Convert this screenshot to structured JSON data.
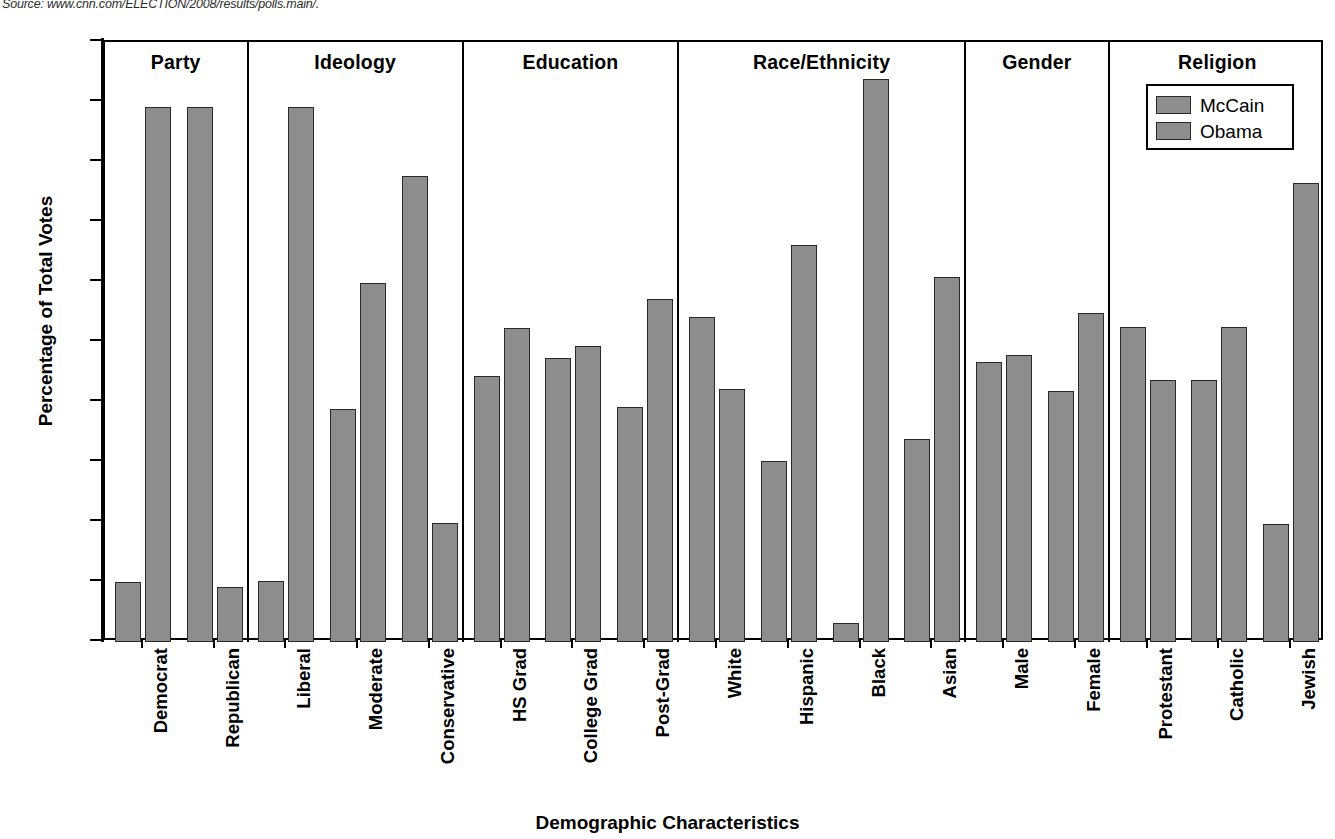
{
  "source_note": "Source: www.cnn.com/ELECTION/2008/results/polls.main/.",
  "legend": {
    "position": "inside-top-right",
    "entries": [
      {
        "label": "McCain",
        "color": "#8d8d8d"
      },
      {
        "label": "Obama",
        "color": "#8d8d8d"
      }
    ]
  },
  "axes": {
    "ylabel": "Percentage of Total Votes",
    "xlabel": "Demographic Characteristics",
    "yticks": [
      100,
      90,
      80,
      70,
      60,
      50,
      40,
      30,
      20,
      10,
      0
    ]
  },
  "chart_data": {
    "type": "bar",
    "title": "",
    "xlabel": "Demographic Characteristics",
    "ylabel": "Percentage of Total Votes",
    "ylim": [
      0,
      100
    ],
    "ytick_step": 10,
    "grid": false,
    "legend_position": "inside-top-right",
    "series": [
      {
        "name": "McCain",
        "color": "#8d8d8d",
        "values": [
          10.0,
          89.2,
          10.2,
          38.8,
          77.7,
          44.3,
          47.3,
          39.1,
          54.2,
          30.1,
          3.1,
          33.9,
          46.7,
          41.8,
          52.5,
          43.7,
          19.7
        ]
      },
      {
        "name": "Obama",
        "color": "#8d8d8d",
        "values": [
          89.2,
          9.2,
          89.2,
          59.8,
          19.9,
          52.3,
          49.3,
          57.2,
          42.1,
          66.1,
          93.9,
          60.8,
          47.8,
          54.8,
          43.7,
          52.5,
          76.5
        ]
      }
    ],
    "categories": [
      "Democrat",
      "Republican",
      "Liberal",
      "Moderate",
      "Conservative",
      "HS Grad",
      "College Grad",
      "Post-Grad",
      "White",
      "Hispanic",
      "Black",
      "Asian",
      "Male",
      "Female",
      "Protestant",
      "Catholic",
      "Jewish"
    ],
    "groups": [
      {
        "title": "Party",
        "categories": [
          {
            "label": "Democrat",
            "mccain": 10.0,
            "obama": 89.2
          },
          {
            "label": "Republican",
            "mccain": 89.2,
            "obama": 9.2
          }
        ]
      },
      {
        "title": "Ideology",
        "categories": [
          {
            "label": "Liberal",
            "mccain": 10.2,
            "obama": 89.2
          },
          {
            "label": "Moderate",
            "mccain": 38.8,
            "obama": 59.8
          },
          {
            "label": "Conservative",
            "mccain": 77.7,
            "obama": 19.9
          }
        ]
      },
      {
        "title": "Education",
        "categories": [
          {
            "label": "HS Grad",
            "mccain": 44.3,
            "obama": 52.3
          },
          {
            "label": "College Grad",
            "mccain": 47.3,
            "obama": 49.3
          },
          {
            "label": "Post-Grad",
            "mccain": 39.1,
            "obama": 57.2
          }
        ]
      },
      {
        "title": "Race/Ethnicity",
        "categories": [
          {
            "label": "White",
            "mccain": 54.2,
            "obama": 42.1
          },
          {
            "label": "Hispanic",
            "mccain": 30.1,
            "obama": 66.1
          },
          {
            "label": "Black",
            "mccain": 3.1,
            "obama": 93.9
          },
          {
            "label": "Asian",
            "mccain": 33.9,
            "obama": 60.8
          }
        ]
      },
      {
        "title": "Gender",
        "categories": [
          {
            "label": "Male",
            "mccain": 46.7,
            "obama": 47.8
          },
          {
            "label": "Female",
            "mccain": 41.8,
            "obama": 54.8
          }
        ]
      },
      {
        "title": "Religion",
        "categories": [
          {
            "label": "Protestant",
            "mccain": 52.5,
            "obama": 43.7
          },
          {
            "label": "Catholic",
            "mccain": 43.7,
            "obama": 52.5
          },
          {
            "label": "Jewish",
            "mccain": 19.7,
            "obama": 76.5
          }
        ]
      }
    ]
  }
}
